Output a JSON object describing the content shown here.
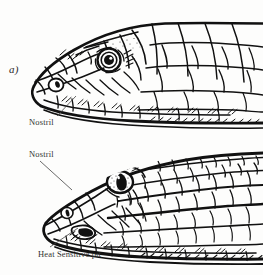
{
  "figure": {
    "background_color": "#fdfdfc",
    "ink_color": "#111111",
    "panels": [
      {
        "id": "a",
        "letter": "a)",
        "subject": "non-pit-viper snake head, lateral view, facing left",
        "eye": {
          "type": "round-pupil",
          "pupil": "round"
        },
        "annotations": [
          {
            "id": "nostril-a",
            "label": "Nostril",
            "leader": {
              "x1": 57,
              "y1": 116,
              "x2": 76,
              "y2": 96
            }
          }
        ]
      },
      {
        "id": "b",
        "letter": "b)",
        "subject": "pit viper snake head, lateral view, facing left",
        "eye": {
          "type": "slit-pupil",
          "pupil": "vertical slit"
        },
        "annotations": [
          {
            "id": "nostril-b",
            "label": "Nostril",
            "leader": {
              "x1": 40,
              "y1": 161,
              "x2": 72,
              "y2": 190
            }
          },
          {
            "id": "pit-b",
            "label": "Heat Sensitive pit",
            "leader": {
              "x1": 50,
              "y1": 247,
              "x2": 78,
              "y2": 228
            }
          }
        ]
      }
    ]
  }
}
